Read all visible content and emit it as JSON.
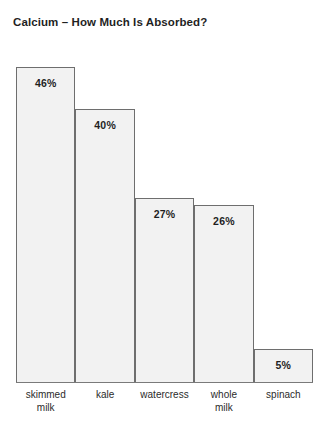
{
  "chart_data": {
    "type": "bar",
    "title": "Calcium – How Much Is Absorbed?",
    "xlabel": "",
    "ylabel": "",
    "ylim": [
      0,
      50
    ],
    "grid": false,
    "legend": "none",
    "value_suffix": "%",
    "categories": [
      "skimmed milk",
      "kale",
      "watercress",
      "whole milk",
      "spinach"
    ],
    "values": [
      46,
      40,
      27,
      26,
      5
    ],
    "bars": [
      {
        "category": "skimmed milk",
        "label_lines": [
          "skimmed",
          "milk"
        ],
        "value": 46,
        "value_label": "46%"
      },
      {
        "category": "kale",
        "label_lines": [
          "kale"
        ],
        "value": 40,
        "value_label": "40%"
      },
      {
        "category": "watercress",
        "label_lines": [
          "watercress"
        ],
        "value": 27,
        "value_label": "27%"
      },
      {
        "category": "whole milk",
        "label_lines": [
          "whole",
          "milk"
        ],
        "value": 26,
        "value_label": "26%"
      },
      {
        "category": "spinach",
        "label_lines": [
          "spinach"
        ],
        "value": 5,
        "value_label": "5%"
      }
    ],
    "colors": {
      "background": "#ffffff",
      "bar_fill": "#f2f2f2",
      "bar_border": "#6e6e6e",
      "axis_line": "#7a7a7a",
      "title_text": "#1f1f1f",
      "label_text": "#2b2b2b"
    }
  }
}
